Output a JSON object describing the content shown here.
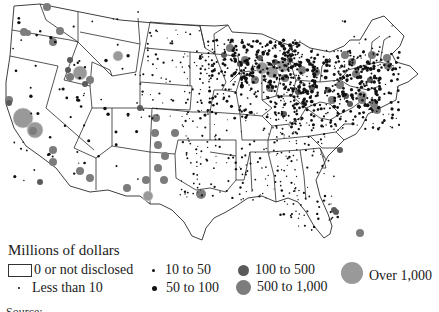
{
  "legend": {
    "title": "Millions of dollars",
    "items": [
      {
        "label": "0 or not disclosed",
        "symbol": "empty-box"
      },
      {
        "label": "Less than 10",
        "symbol": "tiny-dot"
      },
      {
        "label": "10 to 50",
        "symbol": "small-dot"
      },
      {
        "label": "50 to 100",
        "symbol": "medium-dot"
      },
      {
        "label": "100 to 500",
        "symbol": "dark-gray-circle"
      },
      {
        "label": "500 to 1,000",
        "symbol": "gray-circle"
      },
      {
        "label": "Over 1,000",
        "symbol": "large-light-gray-circle"
      }
    ]
  },
  "colors": {
    "state_fill": "#ffffff",
    "state_stroke": "#2a2a2a",
    "dot": "#111111",
    "circle_100_500": "#5a5a5a",
    "circle_500_1000": "#7c7c7c",
    "circle_over_1000": "#999999"
  },
  "map": {
    "region": "Contiguous United States",
    "symbol_type": "proportional circles by county",
    "concentrations": [
      "Upper Midwest (Wisconsin, Minnesota, Iowa)",
      "Northeast (Pennsylvania, New York)",
      "California Central Valley",
      "Idaho",
      "Pacific Northwest",
      "New Mexico / Arizona",
      "Texas",
      "Florida"
    ]
  },
  "caption": {
    "partial_text": "Source: ..."
  }
}
